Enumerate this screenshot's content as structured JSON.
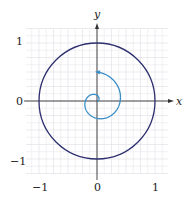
{
  "chart_data": {
    "type": "line",
    "title": "",
    "xlabel": "x",
    "ylabel": "y",
    "xlim": [
      -1.2,
      1.2
    ],
    "ylim": [
      -1.2,
      1.2
    ],
    "grid": true,
    "x_ticks": [
      "-1",
      "0",
      "1"
    ],
    "y_ticks": [
      "1",
      "0",
      "-1"
    ],
    "series": [
      {
        "name": "unit circle",
        "description": "circle of radius 1 centered at origin",
        "color": "#2d2f6e"
      },
      {
        "name": "spiral",
        "description": "outward spiral from origin, counterclockwise, ending with arrow near (0, 0.47)",
        "color": "#3a8fc8"
      }
    ]
  },
  "labels": {
    "x_axis": "x",
    "y_axis": "y",
    "tick_x_neg1": "−1",
    "tick_x_0": "0",
    "tick_x_1": "1",
    "tick_y_1": "1",
    "tick_y_0": "0",
    "tick_y_neg1": "−1"
  },
  "colors": {
    "circle": "#2d2f6e",
    "spiral": "#3a8fc8",
    "axes": "#333333",
    "grid": "#e6e6ea"
  }
}
